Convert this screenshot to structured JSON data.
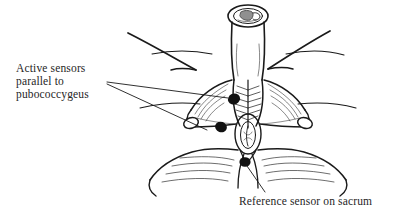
{
  "figure": {
    "kind": "anatomical-line-drawing",
    "background_color": "#ffffff",
    "ink_color": "#1a1a1a",
    "text_color": "#262626",
    "width": 396,
    "height": 220
  },
  "labels": {
    "active": {
      "lines": [
        "Active sensors",
        "parallel to",
        "pubococcygeus"
      ],
      "full_text": "Active sensors parallel to pubococcygeus"
    },
    "reference": {
      "text": "Reference sensor on sacrum"
    }
  },
  "markers": {
    "active_upper": {
      "label": "active-sensor-upper",
      "cx": 234,
      "cy": 99,
      "rx": 6.2,
      "ry": 5.4,
      "rotation": -25
    },
    "active_lower": {
      "label": "active-sensor-lower",
      "cx": 221,
      "cy": 127,
      "rx": 6.0,
      "ry": 5.2,
      "rotation": 20
    },
    "reference_sacral": {
      "label": "reference-sensor-sacral",
      "cx": 245,
      "cy": 162,
      "rx": 5.6,
      "ry": 4.8,
      "rotation": 0
    }
  },
  "leaders": {
    "active_upper": {
      "from_x": 107,
      "from_y": 82,
      "to_x": 228,
      "to_y": 98
    },
    "active_lower": {
      "from_x": 107,
      "from_y": 84,
      "to_x": 206,
      "to_y": 129
    },
    "reference": {
      "from_x": 247,
      "from_y": 166,
      "to_x": 264,
      "to_y": 192
    }
  },
  "arrows": {
    "left_thigh": {
      "label": "left-thigh-contour"
    },
    "right_thigh": {
      "label": "right-thigh-contour"
    }
  }
}
